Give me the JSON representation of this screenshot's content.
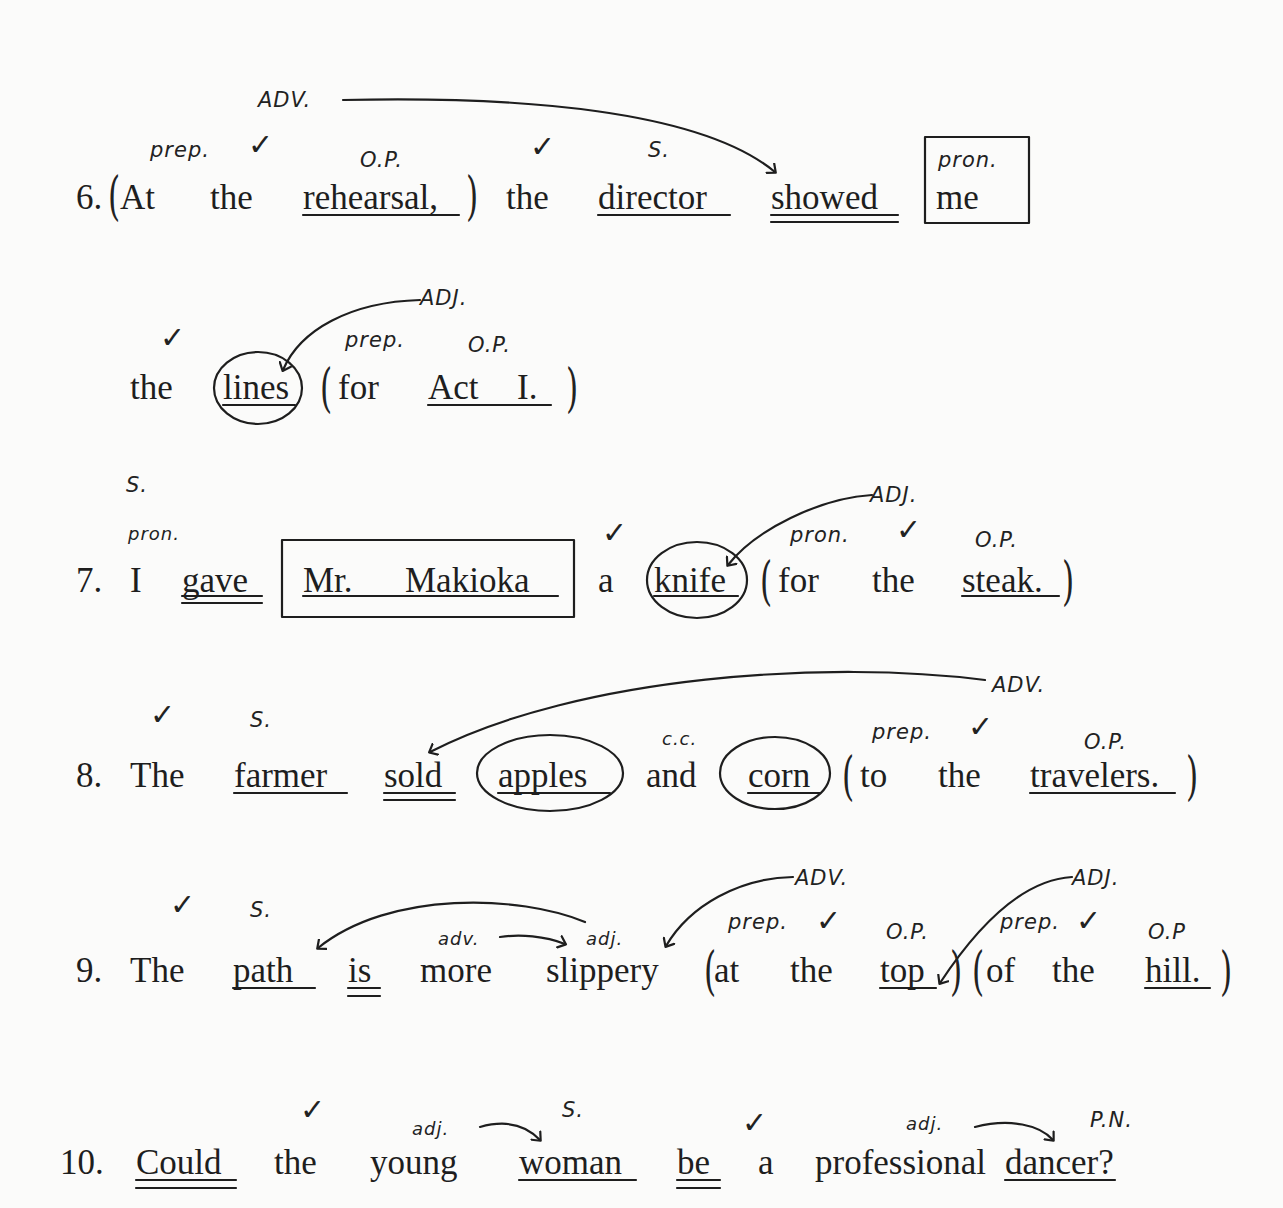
{
  "sentences": [
    {
      "number": "6.",
      "words": [
        "At",
        "the",
        "rehearsal,",
        "the",
        "director",
        "showed",
        "me",
        "the",
        "lines",
        "for",
        "Act",
        "I."
      ],
      "annotations": {
        "adv": "ADV.",
        "prep": "prep.",
        "op": "O.P.",
        "subject": "S.",
        "pron": "pron.",
        "adj": "ADJ.",
        "prep2": "prep.",
        "op2": "O.P."
      }
    },
    {
      "number": "7.",
      "words": [
        "I",
        "gave",
        "Mr.",
        "Makioka",
        "a",
        "knife",
        "for",
        "the",
        "steak."
      ],
      "annotations": {
        "subject": "S.",
        "pron": "pron.",
        "adj": "ADJ.",
        "pron2": "pron.",
        "op": "O.P."
      }
    },
    {
      "number": "8.",
      "words": [
        "The",
        "farmer",
        "sold",
        "apples",
        "and",
        "corn",
        "to",
        "the",
        "travelers."
      ],
      "annotations": {
        "subject": "S.",
        "cc": "c.c.",
        "prep": "prep.",
        "op": "O.P.",
        "adv": "ADV."
      }
    },
    {
      "number": "9.",
      "words": [
        "The",
        "path",
        "is",
        "more",
        "slippery",
        "at",
        "the",
        "top",
        "of",
        "the",
        "hill."
      ],
      "annotations": {
        "subject": "S.",
        "adv_small": "adv.",
        "adj_small": "adj.",
        "adv": "ADV.",
        "prep": "prep.",
        "op": "O.P.",
        "adj": "ADJ.",
        "prep2": "prep.",
        "op2": "O.P"
      }
    },
    {
      "number": "10.",
      "words": [
        "Could",
        "the",
        "young",
        "woman",
        "be",
        "a",
        "professional",
        "dancer?"
      ],
      "annotations": {
        "adj": "adj.",
        "subject": "S.",
        "adj2": "adj.",
        "pn": "P.N."
      }
    }
  ],
  "marks": {
    "check": "✓"
  }
}
